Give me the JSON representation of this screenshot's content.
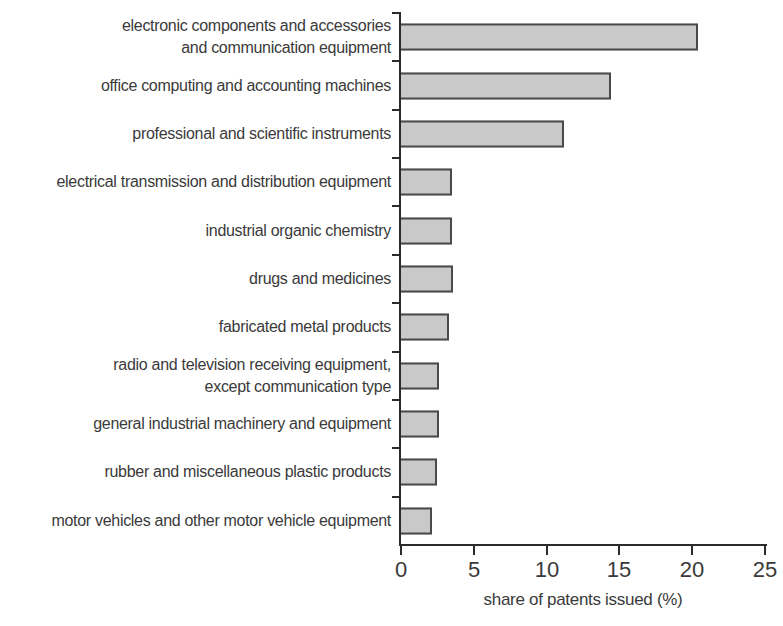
{
  "chart_data": {
    "type": "bar",
    "orientation": "horizontal",
    "categories": [
      "electronic components and accessories\nand communication equipment",
      "office computing and accounting machines",
      "professional and scientific instruments",
      "electrical transmission and distribution equipment",
      "industrial organic chemistry",
      "drugs and medicines",
      "fabricated metal products",
      "radio and television receiving equipment,\nexcept communication type",
      "general industrial machinery and equipment",
      "rubber and miscellaneous plastic products",
      "motor vehicles and other motor vehicle equipment"
    ],
    "values": [
      20.4,
      14.4,
      11.2,
      3.5,
      3.5,
      3.6,
      3.3,
      2.6,
      2.6,
      2.5,
      2.1
    ],
    "xlabel": "share of patents issued (%)",
    "xlim": [
      0,
      25
    ],
    "xticks": [
      0,
      5,
      10,
      15,
      20,
      25
    ],
    "grid": false,
    "colors": {
      "bar_fill": "#c9c9c9",
      "bar_border": "#4a4a4a",
      "axis": "#2b2b2b",
      "text": "#3a3a3a",
      "background": "#ffffff"
    }
  }
}
